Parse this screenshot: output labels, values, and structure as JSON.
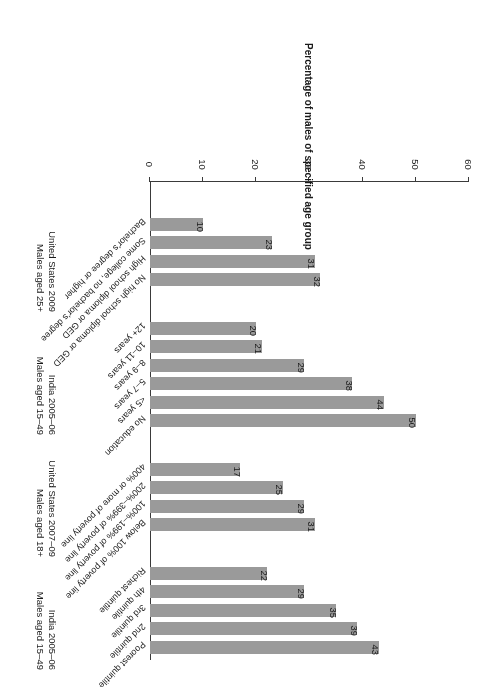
{
  "chart_data": {
    "type": "bar",
    "orientation": "horizontal",
    "title": "",
    "subtitle": "",
    "xlabel": "",
    "ylabel": "Percentage of males of specified age group",
    "ylim": [
      0,
      60
    ],
    "tick_labels": [
      "0",
      "10",
      "20",
      "30",
      "40",
      "50",
      "60"
    ],
    "tick_values": [
      0,
      10,
      20,
      30,
      40,
      50,
      60
    ],
    "grid": false,
    "legend": "none",
    "bar_color": "#9a9a9a",
    "axis_color": "#3a3a3a",
    "groups": [
      {
        "name": "india-wealth",
        "label_line1": "India 2005–06",
        "label_line2": "Males aged 15–49",
        "categories": [
          "Poorest quintile",
          "2nd quintile",
          "3rd quintile",
          "4th quintile",
          "Richest quintile"
        ],
        "values": [
          43,
          39,
          35,
          29,
          22
        ]
      },
      {
        "name": "us-poverty",
        "label_line1": "United States 2007–09",
        "label_line2": "Males aged 18+",
        "categories": [
          "Below 100% of poverty line",
          "100%–199% of poverty line",
          "200%–399% of poverty line",
          "400% or more of poverty line"
        ],
        "values": [
          31,
          29,
          25,
          17
        ]
      },
      {
        "name": "india-education",
        "label_line1": "India 2005–06",
        "label_line2": "Males aged 15–49",
        "categories": [
          "No education",
          "<5 years",
          "5–7 years",
          "8–9 years",
          "10–11 years",
          "12+ years"
        ],
        "values": [
          50,
          44,
          38,
          29,
          21,
          20
        ]
      },
      {
        "name": "us-education",
        "label_line1": "United States 2009",
        "label_line2": "Males aged 25+",
        "categories": [
          "No high school diploma or GED",
          "High school diploma or GED",
          "Some college, no bachelor's degree",
          "Bachelor's degree or higher"
        ],
        "values": [
          32,
          31,
          23,
          10
        ]
      }
    ]
  }
}
